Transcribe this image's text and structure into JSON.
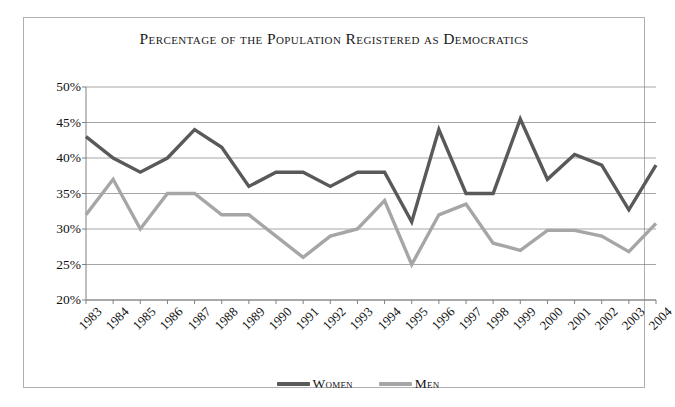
{
  "chart_data": {
    "type": "line",
    "title": "Percentage of the Population Registered as Democratics",
    "xlabel": "",
    "ylabel": "",
    "ylim": [
      20,
      50
    ],
    "ytick_step": 5,
    "ytick_labels": [
      "50%",
      "45%",
      "40%",
      "35%",
      "30%",
      "25%",
      "20%"
    ],
    "ytick_values": [
      50,
      45,
      40,
      35,
      30,
      25,
      20
    ],
    "grid": true,
    "legend_position": "bottom",
    "categories": [
      "1983",
      "1984",
      "1985",
      "1986",
      "1987",
      "1988",
      "1989",
      "1990",
      "1991",
      "1992",
      "1993",
      "1994",
      "1995",
      "1996",
      "1997",
      "1998",
      "1999",
      "2000",
      "2001",
      "2002",
      "2003",
      "2004"
    ],
    "series": [
      {
        "name": "Women",
        "color": "#595959",
        "values": [
          43.0,
          40.0,
          38.0,
          40.0,
          44.0,
          41.5,
          36.0,
          38.0,
          38.0,
          36.0,
          38.0,
          38.0,
          31.0,
          44.0,
          35.0,
          35.0,
          45.5,
          37.0,
          40.5,
          39.0,
          32.7,
          39.0
        ]
      },
      {
        "name": "Men",
        "color": "#a6a6a6",
        "values": [
          32.0,
          37.0,
          30.0,
          35.0,
          35.0,
          32.0,
          32.0,
          29.0,
          26.0,
          29.0,
          30.0,
          34.0,
          25.0,
          32.0,
          33.5,
          28.0,
          27.0,
          29.8,
          29.8,
          29.0,
          26.8,
          30.8
        ]
      }
    ]
  },
  "legend": {
    "items": [
      {
        "label": "Women",
        "color": "#595959"
      },
      {
        "label": "Men",
        "color": "#a6a6a6"
      }
    ]
  },
  "style": {
    "grid_color": "#808080",
    "axis_color": "#808080",
    "frame_color": "#b0b0b4",
    "background": "#ffffff",
    "text_color": "#111111"
  }
}
